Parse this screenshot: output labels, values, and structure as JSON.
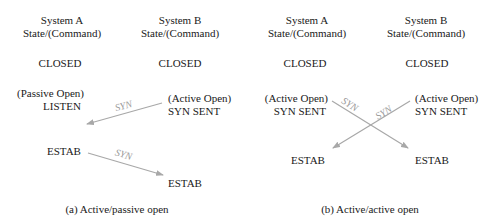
{
  "panel_a": {
    "col_a": {
      "title": "System A",
      "subtitle": "State/(Command)",
      "closed": "CLOSED",
      "cmd": "(Passive Open)",
      "state": "LISTEN",
      "estab": "ESTAB"
    },
    "col_b": {
      "title": "System B",
      "subtitle": "State/(Command)",
      "closed": "CLOSED",
      "cmd": "(Active Open)",
      "state": "SYN SENT",
      "estab": "ESTAB"
    },
    "arrow1_label": "SYN",
    "arrow2_label": "SYN",
    "caption": "(a) Active/passive open"
  },
  "panel_b": {
    "col_a": {
      "title": "System A",
      "subtitle": "State/(Command)",
      "closed": "CLOSED",
      "cmd": "(Active Open)",
      "state": "SYN SENT",
      "estab": "ESTAB"
    },
    "col_b": {
      "title": "System B",
      "subtitle": "State/(Command)",
      "closed": "CLOSED",
      "cmd": "(Active Open)",
      "state": "SYN SENT",
      "estab": "ESTAB"
    },
    "arrow1_label": "SYN",
    "arrow2_label": "SYN",
    "caption": "(b) Active/active open"
  },
  "colors": {
    "arrow": "#a8a8a8",
    "text": "#1a1a1a"
  }
}
